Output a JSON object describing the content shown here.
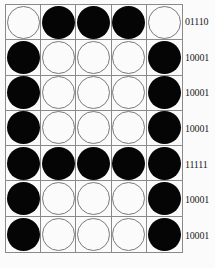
{
  "rows": [
    {
      "bits": [
        0,
        1,
        1,
        1,
        0
      ],
      "label": "01110"
    },
    {
      "bits": [
        1,
        0,
        0,
        0,
        1
      ],
      "label": "10001"
    },
    {
      "bits": [
        1,
        0,
        0,
        0,
        1
      ],
      "label": "10001"
    },
    {
      "bits": [
        1,
        0,
        0,
        0,
        1
      ],
      "label": "10001"
    },
    {
      "bits": [
        1,
        1,
        1,
        1,
        1
      ],
      "label": "11111"
    },
    {
      "bits": [
        1,
        0,
        0,
        0,
        1
      ],
      "label": "10001"
    },
    {
      "bits": [
        1,
        0,
        0,
        0,
        1
      ],
      "label": "10001"
    }
  ],
  "colors": {
    "on": "#050505",
    "off": "#fbfbfb",
    "grid": "#8a8a8a"
  }
}
